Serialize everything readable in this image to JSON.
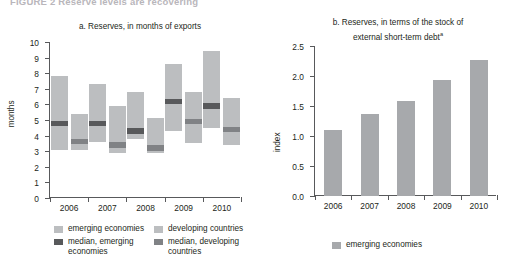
{
  "page_header": "FIGURE 2    Reserve levels are recovering",
  "panel_a": {
    "title_prefix": "a.",
    "title": "a.  Reserves, in months of exports",
    "ylabel": "months",
    "yticks": [
      "0",
      "1",
      "2",
      "3",
      "4",
      "5",
      "6",
      "7",
      "8",
      "9",
      "10"
    ],
    "xticks": [
      "2006",
      "2007",
      "2008",
      "2009",
      "2010"
    ],
    "legend": [
      {
        "label": "emerging economies",
        "swatch": "light"
      },
      {
        "label": "median, emerging economies",
        "swatch": "dark"
      },
      {
        "label": "developing countries",
        "swatch": "light"
      },
      {
        "label": "median, developing countries",
        "swatch": "mid"
      }
    ]
  },
  "panel_b": {
    "title_line1": "b.  Reserves, in terms of the stock of",
    "title_line2": "external short-term debt",
    "title_footnote": "a",
    "ylabel": "index",
    "yticks": [
      "0.0",
      "0.5",
      "1.0",
      "1.5",
      "2.0",
      "2.5"
    ],
    "xticks": [
      "2006",
      "2007",
      "2008",
      "2009",
      "2010"
    ],
    "legend": [
      {
        "label": "emerging economies",
        "swatch": "bar"
      }
    ]
  },
  "colors": {
    "range_light": "#bcbec0",
    "median_dark": "#58595b",
    "median_mid": "#808285",
    "bar_gray": "#a7a9ac",
    "axis": "#58595b",
    "text": "#231f20"
  },
  "chart_data": [
    {
      "type": "bar",
      "chart_id": "panel-a",
      "title": "a.  Reserves, in months of exports",
      "xlabel": "",
      "ylabel": "months",
      "ylim": [
        0,
        10
      ],
      "grid": false,
      "legend_position": "bottom-left",
      "categories": [
        "2006",
        "2007",
        "2008",
        "2009",
        "2010"
      ],
      "notes": "Floating range bars show interquartile-style ranges; dark blocks mark the median.",
      "series": [
        {
          "name": "emerging economies",
          "kind": "range",
          "color": "#bcbec0",
          "low": [
            3.1,
            3.6,
            3.8,
            4.3,
            4.5
          ],
          "high": [
            7.8,
            7.3,
            6.8,
            8.6,
            9.4
          ],
          "median": [
            4.8,
            4.8,
            4.3,
            6.2,
            5.9
          ],
          "median_color": "#58595b"
        },
        {
          "name": "developing countries",
          "kind": "range",
          "color": "#bcbec0",
          "low": [
            3.1,
            2.9,
            2.9,
            3.5,
            3.4
          ],
          "high": [
            5.4,
            5.9,
            5.1,
            6.8,
            6.4
          ],
          "median": [
            3.6,
            3.4,
            3.2,
            4.9,
            4.4
          ],
          "median_color": "#808285"
        }
      ]
    },
    {
      "type": "bar",
      "chart_id": "panel-b",
      "title": "b.  Reserves, in terms of the stock of external short-term debt",
      "xlabel": "",
      "ylabel": "index",
      "ylim": [
        0,
        2.5
      ],
      "grid": false,
      "legend_position": "bottom-center",
      "categories": [
        "2006",
        "2007",
        "2008",
        "2009",
        "2010"
      ],
      "series": [
        {
          "name": "emerging economies",
          "kind": "bar",
          "color": "#a7a9ac",
          "values": [
            1.1,
            1.36,
            1.58,
            1.93,
            2.26
          ]
        }
      ]
    }
  ]
}
